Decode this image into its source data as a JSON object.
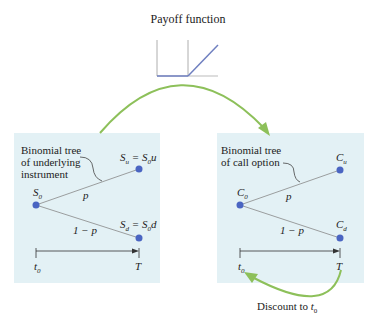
{
  "title": "Payoff function",
  "left": {
    "label_lines": [
      "Binomial tree",
      "of underlying",
      "instrument"
    ],
    "root": "S",
    "root_sub": "0",
    "up": "S",
    "up_sub": "u",
    "up_eq": " = S",
    "up_eq_sub": "0",
    "up_tail": "u",
    "down": "S",
    "down_sub": "d",
    "down_eq": " = S",
    "down_eq_sub": "0",
    "down_tail": "d",
    "p_up": "p",
    "p_down": "1 − p",
    "t_start": "t",
    "t_start_sub": "0",
    "t_end": "T"
  },
  "right": {
    "label_lines": [
      "Binomial tree",
      "of call option"
    ],
    "root": "C",
    "root_sub": "0",
    "up": "C",
    "up_sub": "u",
    "down": "C",
    "down_sub": "d",
    "p_up": "p",
    "p_down": "1 − p",
    "t_start": "t",
    "t_start_sub": "0",
    "t_end": "T"
  },
  "discount": {
    "text": "Discount to ",
    "var": "t",
    "var_sub": "0"
  },
  "colors": {
    "box": "#e3f1f5",
    "node": "#4a65c2",
    "arrow": "#8dc05a",
    "payoff": "#6f7fc0"
  }
}
